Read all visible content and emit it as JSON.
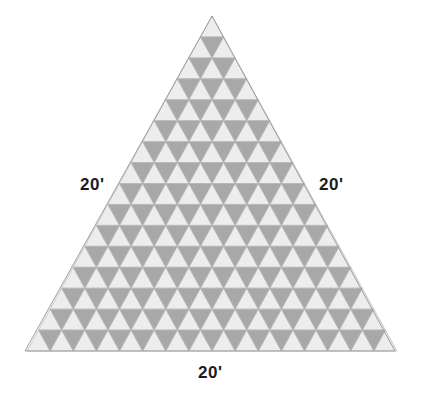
{
  "figure": {
    "shape_name": "equilateral-triangle",
    "unit_symbol": "'",
    "colors": {
      "background": "#ffffff",
      "up_triangle_fill": "#ededed",
      "down_triangle_fill": "#a8a8a8",
      "grid_stroke": "#b9b9b9",
      "outline_stroke": "#9c9c9c",
      "label_text": "#1c1c1c"
    },
    "geometry": {
      "apex_x": 212,
      "apex_y": 16,
      "bottom_left_x": 25,
      "bottom_left_y": 351,
      "bottom_right_x": 395,
      "bottom_right_y": 351,
      "rows": 16,
      "base_length_px": 370,
      "height_px": 335,
      "cell_width_px": 23.125,
      "cell_height_px": 20.9375,
      "up_triangle_count": 256,
      "down_triangle_count": 240,
      "total_triangle_count": 496
    }
  },
  "labels": {
    "left": {
      "text": "20'",
      "value": 20,
      "unit": "feet",
      "side": "left-side"
    },
    "right": {
      "text": "20'",
      "value": 20,
      "unit": "feet",
      "side": "right-side"
    },
    "bottom": {
      "text": "20'",
      "value": 20,
      "unit": "feet",
      "side": "base"
    }
  }
}
